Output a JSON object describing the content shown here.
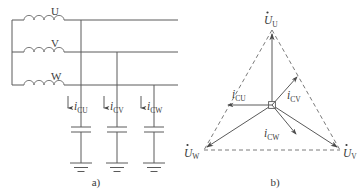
{
  "figure": {
    "caption_a": "a)",
    "caption_b": "b)"
  },
  "circuit": {
    "phase_labels": [
      "U",
      "V",
      "W"
    ],
    "current_labels": [
      {
        "symbol": "i",
        "subscript": "CU"
      },
      {
        "symbol": "i",
        "subscript": "CV"
      },
      {
        "symbol": "i",
        "subscript": "CW"
      }
    ],
    "components": {
      "winding_icon": "inductor-coil-icon",
      "capacitor_icon": "capacitor-icon",
      "ground_icon": "ground-icon",
      "current_arrow_icon": "down-arrow-icon"
    }
  },
  "phasor": {
    "voltage_labels": [
      {
        "symbol": "U",
        "subscript": "U",
        "dot": true
      },
      {
        "symbol": "U",
        "subscript": "V",
        "dot": true
      },
      {
        "symbol": "U",
        "subscript": "W",
        "dot": true
      }
    ],
    "current_labels": [
      {
        "symbol": "i",
        "subscript": "CU"
      },
      {
        "symbol": "i",
        "subscript": "CV"
      },
      {
        "symbol": "i",
        "subscript": "CW"
      }
    ],
    "origin_marker": "origin-node-icon",
    "triangle_style": "dashed"
  },
  "colors": {
    "line": "#5a5a5a",
    "dashed": "#6b6b6b",
    "text": "#3a3a3a",
    "background": "#ffffff"
  }
}
